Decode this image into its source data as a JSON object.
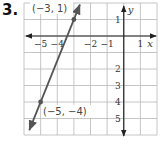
{
  "problem": {
    "number": "3."
  },
  "chart_data": {
    "type": "line",
    "title": "",
    "xlabel": "x",
    "ylabel": "y",
    "xlim": [
      -6,
      2
    ],
    "ylim": [
      -6,
      2
    ],
    "grid": true,
    "x_tick_labels": [
      {
        "value": -5,
        "label": "−5"
      },
      {
        "value": -4,
        "label": "−4"
      },
      {
        "value": -2,
        "label": "−2"
      },
      {
        "value": -1,
        "label": "−1"
      },
      {
        "value": 1,
        "label": "1"
      }
    ],
    "y_tick_labels": [
      {
        "value": 1,
        "label": "1"
      },
      {
        "value": -2,
        "label": "2"
      },
      {
        "value": -3,
        "label": "3"
      },
      {
        "value": -4,
        "label": "4"
      },
      {
        "value": -5,
        "label": "5"
      }
    ],
    "series": [
      {
        "name": "line",
        "points": [
          {
            "x": -3,
            "y": 1
          },
          {
            "x": -5,
            "y": -4
          }
        ],
        "arrows_both_ends": true
      }
    ],
    "annotations": [
      {
        "text": "(−3, 1)",
        "x": -3,
        "y": 1
      },
      {
        "text": "(−5, −4)",
        "x": -5,
        "y": -4
      }
    ],
    "colors": {
      "line": "#555555",
      "grid": "#b8b8b8",
      "axis": "#222222"
    }
  }
}
